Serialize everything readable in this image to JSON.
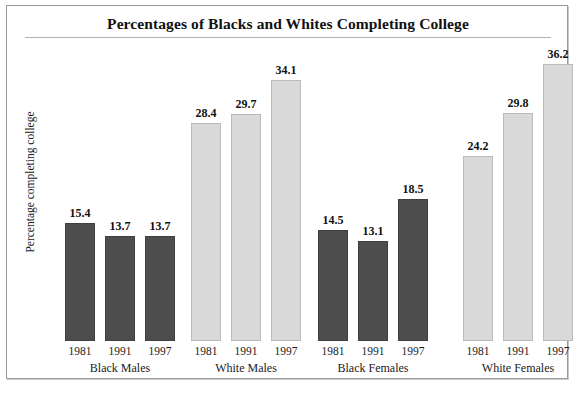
{
  "chart_data": {
    "type": "bar",
    "title": "Percentages of Blacks and Whites Completing College",
    "xlabel": "",
    "ylabel": "Percentage completing college",
    "ylim": [
      0,
      40
    ],
    "grid": false,
    "legend": "none",
    "categories": [
      "1981",
      "1991",
      "1997"
    ],
    "groups": [
      {
        "name": "Black Males",
        "color": "#4d4d4d",
        "values": [
          15.4,
          13.7,
          13.7
        ],
        "labels": [
          "15.4",
          "13.7",
          "13.7"
        ],
        "years": [
          "1981",
          "1991",
          "1997"
        ]
      },
      {
        "name": "White Males",
        "color": "#d9d9d9",
        "values": [
          28.4,
          29.7,
          34.1
        ],
        "labels": [
          "28.4",
          "29.7",
          "34.1"
        ],
        "years": [
          "1981",
          "1991",
          "1997"
        ]
      },
      {
        "name": "Black Females",
        "color": "#4d4d4d",
        "values": [
          14.5,
          13.1,
          18.5
        ],
        "labels": [
          "14.5",
          "13.1",
          "18.5"
        ],
        "years": [
          "1981",
          "1991",
          "1997"
        ]
      },
      {
        "name": "White Females",
        "color": "#d9d9d9",
        "values": [
          24.2,
          29.8,
          36.2
        ],
        "labels": [
          "24.2",
          "29.8",
          "36.2"
        ],
        "years": [
          "1981",
          "1991",
          "1997"
        ]
      }
    ]
  },
  "colors": {
    "black_series": "#4d4d4d",
    "white_series": "#d9d9d9",
    "frame": "#9a9a9a",
    "text": "#1a1a1a"
  }
}
